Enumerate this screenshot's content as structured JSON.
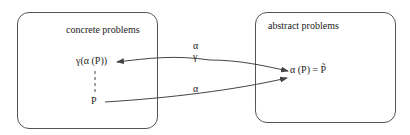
{
  "diagram": {
    "left_box": {
      "title": "concrete problems"
    },
    "right_box": {
      "title": "abstract problems"
    },
    "nodes": {
      "gamma_alpha_p": "γ(α (P))",
      "p": "P",
      "alpha_p_eq": "α (P) = P̃"
    },
    "edge_labels": {
      "top_alpha": "α",
      "top_gamma": "γ",
      "bottom_alpha": "α"
    },
    "colors": {
      "line": "#444444",
      "text": "#222222"
    }
  }
}
